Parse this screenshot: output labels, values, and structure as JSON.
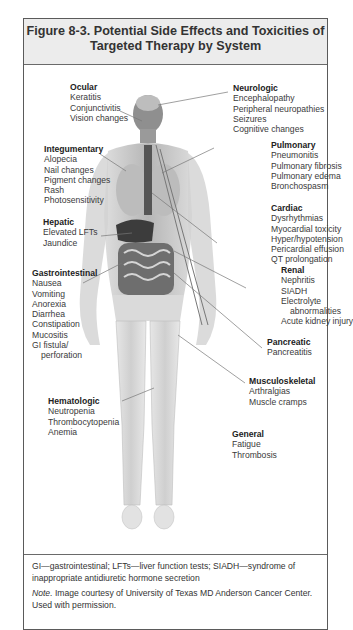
{
  "figure": {
    "title_line1": "Figure 8-3. Potential Side Effects and Toxicities of",
    "title_line2": "Targeted Therapy by System"
  },
  "systems": {
    "neurologic": {
      "label": "Neurologic",
      "items": [
        "Encephalopathy",
        "Peripheral neuropathies",
        "Seizures",
        "Cognitive changes"
      ]
    },
    "ocular": {
      "label": "Ocular",
      "items": [
        "Keratitis",
        "Conjunctivitis",
        "Vision changes"
      ]
    },
    "integumentary": {
      "label": "Integumentary",
      "items": [
        "Alopecia",
        "Nail changes",
        "Pigment changes",
        "Rash",
        "Photosensitivity"
      ]
    },
    "pulmonary": {
      "label": "Pulmonary",
      "items": [
        "Pneumonitis",
        "Pulmonary fibrosis",
        "Pulmonary edema",
        "Bronchospasm"
      ]
    },
    "cardiac": {
      "label": "Cardiac",
      "items": [
        "Dysrhythmias",
        "Myocardial toxicity",
        "Hyper/hypotension",
        "Pericardial effusion",
        "QT prolongation"
      ]
    },
    "hepatic": {
      "label": "Hepatic",
      "items": [
        "Elevated LFTs",
        "Jaundice"
      ]
    },
    "gastrointestinal": {
      "label": "Gastrointestinal",
      "items": [
        "Nausea",
        "Vomiting",
        "Anorexia",
        "Diarrhea",
        "Constipation",
        "Mucositis",
        "GI fistula/",
        "perforation"
      ]
    },
    "renal": {
      "label": "Renal",
      "items": [
        "Nephritis",
        "SIADH",
        "Electrolyte",
        "abnormalities",
        "Acute kidney injury"
      ]
    },
    "pancreatic": {
      "label": "Pancreatic",
      "items": [
        "Pancreatitis"
      ]
    },
    "musculoskeletal": {
      "label": "Musculoskeletal",
      "items": [
        "Arthralgias",
        "Muscle cramps"
      ]
    },
    "hematologic": {
      "label": "Hematologic",
      "items": [
        "Neutropenia",
        "Thrombocytopenia",
        "Anemia"
      ]
    },
    "general": {
      "label": "General",
      "items": [
        "Fatigue",
        "Thrombosis"
      ]
    }
  },
  "footnote": {
    "abbreviations": "GI—gastrointestinal; LFTs—liver function tests; SIADH—syndrome of inappropriate antidiuretic hormone secretion",
    "note_label": "Note.",
    "note_text": " Image courtesy of University of Texas MD Anderson Cancer Center. Used with permission."
  },
  "colors": {
    "frame": "#5a5a5a",
    "title_band": "#ececec",
    "text": "#2a2a2a"
  }
}
